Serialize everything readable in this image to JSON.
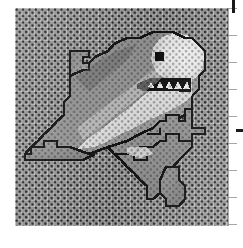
{
  "document": {
    "title": "Cross-Stitch Chart — Great White Shark",
    "subject": "great-white-shark",
    "medium": "aida cross-stitch fabric"
  },
  "canvas": {
    "width": 243,
    "height": 248,
    "background_color": "#ffffff"
  },
  "fabric": {
    "label": "aida cloth",
    "x": 15,
    "y": 8,
    "width": 213,
    "height": 218,
    "base_color": "#b9b9b9",
    "weave_dot_color": "#282828",
    "weave_pitch_px": 6.4
  },
  "motif": {
    "name": "shark",
    "outline_color": "#141414",
    "outline_width": 2.6,
    "colors": {
      "outline": "#141414",
      "dorsal_dark": "#8d8d8d",
      "body_mid": "#a8a8a8",
      "belly_light": "#ededed",
      "belly_highlight": "#fbfbfb",
      "eye": "#101010",
      "tooth": "#f4f4f4",
      "fin_shadow": "#9a9a9a"
    },
    "parts": [
      {
        "name": "snout-and-head",
        "shade": "belly_light"
      },
      {
        "name": "upper-body-dorsal",
        "shade": "dorsal_dark"
      },
      {
        "name": "belly",
        "shade": "belly_highlight"
      },
      {
        "name": "dorsal-fin",
        "shade": "dorsal_dark"
      },
      {
        "name": "left-pectoral-fin",
        "shade": "body_mid"
      },
      {
        "name": "right-pectoral-fin",
        "shade": "body_mid"
      },
      {
        "name": "tail-fin",
        "shade": "fin_shadow"
      },
      {
        "name": "open-mouth",
        "shade": "outline"
      },
      {
        "name": "teeth",
        "shade": "tooth",
        "count": 7
      },
      {
        "name": "eye",
        "shade": "eye"
      }
    ],
    "orientation": "diagonal, head upper-right, tail lower-centre"
  },
  "edge_marks": {
    "top_tick": {
      "x": 232,
      "y": 0,
      "width": 3,
      "height": 13,
      "color": "#1a1a1a"
    },
    "right_tick": {
      "x": 236,
      "y": 129,
      "width": 7,
      "height": 3,
      "color": "#1a1a1a"
    },
    "ruler_color": "#969696"
  }
}
